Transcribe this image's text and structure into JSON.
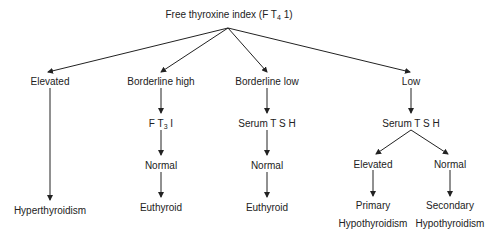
{
  "diagram": {
    "root": {
      "text": "Free thyroxine index (F T",
      "sub": "4",
      "suffix": " 1)"
    },
    "branches": [
      {
        "label": "Elevated",
        "steps": [],
        "result": "Hyperthyroidism"
      },
      {
        "label": "Borderline high",
        "test": {
          "text": "F T",
          "sub": "3",
          "suffix": " I"
        },
        "finding": "Normal",
        "result": "Euthyroid"
      },
      {
        "label": "Borderline low",
        "test": {
          "text": "Serum T S H"
        },
        "finding": "Normal",
        "result": "Euthyroid"
      },
      {
        "label": "Low",
        "test": {
          "text": "Serum T S H"
        },
        "subbranches": [
          {
            "label": "Elevated",
            "result_line1": "Primary",
            "result_line2": "Hypothyroidism"
          },
          {
            "label": "Normal",
            "result_line1": "Secondary",
            "result_line2": "Hypothyroidism"
          }
        ]
      }
    ]
  }
}
